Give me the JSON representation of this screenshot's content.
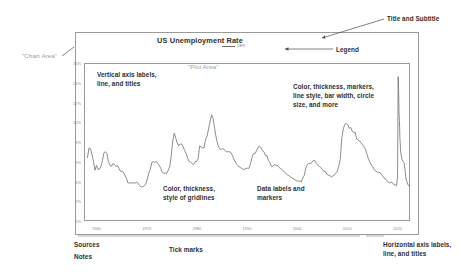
{
  "chart": {
    "title": "US Unemployment Rate",
    "legend_label": "UER"
  },
  "annotations": {
    "title_subtitle": "Title and Subtitle",
    "legend": "Legend",
    "chart_area": "\"Chart Area\"",
    "plot_area": "\"Plot Area\"",
    "vertical_axis": "Vertical axis labels,\nline, and titles",
    "color_thickness_markers": "Color, thickness, markers,\nline style, bar width, circle\nsize, and more",
    "gridlines": "Color, thickness,\nstyle of gridlines",
    "data_labels": "Data labels and\nmarkers",
    "sources": "Sources",
    "notes": "Notes",
    "tick_marks": "Tick marks",
    "horizontal_axis": "Horizontal axis labels,\nline, and titles"
  },
  "colors": {
    "line": "#6e6e6e",
    "frame": "#9a9a9a",
    "text": "#2f2f2f",
    "ghost_text": "#9e9e9e",
    "tick_text": "#8a8a8a",
    "background": "#ffffff"
  },
  "chart_data": {
    "type": "line",
    "title": "US Unemployment Rate",
    "xlabel": "",
    "ylabel": "",
    "xlim": [
      1957.5,
      2022.5
    ],
    "ylim": [
      0,
      16
    ],
    "grid": false,
    "legend_position": "top-center",
    "y_tick_labels": [
      "0%",
      "2%",
      "4%",
      "6%",
      "8%",
      "10%",
      "12%",
      "14%",
      "16%"
    ],
    "y_ticks": [
      0,
      2,
      4,
      6,
      8,
      10,
      12,
      14,
      16
    ],
    "x_tick_labels": [
      "1960",
      "1970",
      "1980",
      "1990",
      "2000",
      "2010",
      "2020"
    ],
    "x_ticks": [
      1960,
      1970,
      1980,
      1990,
      2000,
      2010,
      2020
    ],
    "series": [
      {
        "name": "UER",
        "x": [
          1958.0,
          1958.3,
          1958.6,
          1958.9,
          1959.2,
          1959.5,
          1959.8,
          1960.1,
          1960.4,
          1960.7,
          1961.0,
          1961.3,
          1961.6,
          1961.9,
          1962.2,
          1962.5,
          1962.8,
          1963.1,
          1963.4,
          1963.7,
          1964.0,
          1964.3,
          1964.6,
          1964.9,
          1965.2,
          1965.5,
          1965.8,
          1966.1,
          1966.4,
          1966.7,
          1967.0,
          1967.3,
          1967.6,
          1967.9,
          1968.2,
          1968.5,
          1968.8,
          1969.1,
          1969.4,
          1969.7,
          1970.0,
          1970.3,
          1970.6,
          1970.9,
          1971.2,
          1971.5,
          1971.8,
          1972.1,
          1972.4,
          1972.7,
          1973.0,
          1973.3,
          1973.6,
          1973.9,
          1974.2,
          1974.5,
          1974.8,
          1975.1,
          1975.4,
          1975.7,
          1976.0,
          1976.3,
          1976.6,
          1976.9,
          1977.2,
          1977.5,
          1977.8,
          1978.1,
          1978.4,
          1978.7,
          1979.0,
          1979.3,
          1979.6,
          1979.9,
          1980.2,
          1980.5,
          1980.8,
          1981.1,
          1981.4,
          1981.7,
          1982.0,
          1982.3,
          1982.6,
          1982.9,
          1983.2,
          1983.5,
          1983.8,
          1984.1,
          1984.4,
          1984.7,
          1985.0,
          1985.3,
          1985.6,
          1985.9,
          1986.2,
          1986.5,
          1986.8,
          1987.1,
          1987.4,
          1987.7,
          1988.0,
          1988.3,
          1988.6,
          1988.9,
          1989.2,
          1989.5,
          1989.8,
          1990.1,
          1990.4,
          1990.7,
          1991.0,
          1991.3,
          1991.6,
          1991.9,
          1992.2,
          1992.5,
          1992.8,
          1993.1,
          1993.4,
          1993.7,
          1994.0,
          1994.3,
          1994.6,
          1994.9,
          1995.2,
          1995.5,
          1995.8,
          1996.1,
          1996.4,
          1996.7,
          1997.0,
          1997.3,
          1997.6,
          1997.9,
          1998.2,
          1998.5,
          1998.8,
          1999.1,
          1999.4,
          1999.7,
          2000.0,
          2000.3,
          2000.6,
          2000.9,
          2001.2,
          2001.5,
          2001.8,
          2002.1,
          2002.4,
          2002.7,
          2003.0,
          2003.3,
          2003.6,
          2003.9,
          2004.2,
          2004.5,
          2004.8,
          2005.1,
          2005.4,
          2005.7,
          2006.0,
          2006.3,
          2006.6,
          2006.9,
          2007.2,
          2007.5,
          2007.8,
          2008.1,
          2008.4,
          2008.7,
          2009.0,
          2009.3,
          2009.6,
          2009.9,
          2010.2,
          2010.5,
          2010.8,
          2011.1,
          2011.4,
          2011.7,
          2012.0,
          2012.3,
          2012.6,
          2012.9,
          2013.2,
          2013.5,
          2013.8,
          2014.1,
          2014.4,
          2014.7,
          2015.0,
          2015.3,
          2015.6,
          2015.9,
          2016.2,
          2016.5,
          2016.8,
          2017.1,
          2017.4,
          2017.7,
          2018.0,
          2018.3,
          2018.6,
          2018.9,
          2019.2,
          2019.5,
          2019.8,
          2020.0,
          2020.2,
          2020.33,
          2020.42,
          2020.5,
          2020.58,
          2020.67,
          2020.75,
          2020.83,
          2020.92,
          2021.1,
          2021.3,
          2021.5,
          2021.7,
          2021.9,
          2022.1,
          2022.3,
          2022.5
        ],
        "y": [
          6.4,
          7.4,
          7.3,
          6.7,
          6.0,
          5.1,
          5.6,
          5.2,
          5.2,
          5.5,
          6.1,
          6.9,
          7.0,
          6.8,
          6.0,
          5.6,
          5.5,
          5.8,
          5.7,
          5.5,
          5.6,
          5.3,
          5.0,
          5.0,
          4.9,
          4.6,
          4.3,
          3.8,
          3.8,
          3.8,
          3.8,
          3.8,
          3.8,
          3.9,
          3.7,
          3.5,
          3.4,
          3.4,
          3.5,
          3.7,
          4.2,
          4.8,
          5.2,
          5.9,
          6.0,
          5.9,
          6.0,
          5.8,
          5.6,
          5.3,
          4.9,
          4.8,
          4.8,
          4.8,
          5.1,
          5.5,
          6.6,
          8.1,
          8.9,
          8.4,
          7.9,
          7.6,
          7.8,
          7.8,
          7.5,
          7.1,
          6.8,
          6.3,
          6.0,
          5.9,
          5.8,
          5.7,
          6.0,
          6.0,
          6.3,
          7.6,
          7.5,
          7.4,
          7.4,
          8.3,
          8.6,
          9.4,
          10.1,
          10.8,
          10.4,
          9.4,
          8.5,
          7.8,
          7.4,
          7.2,
          7.3,
          7.3,
          7.1,
          7.0,
          7.0,
          7.0,
          6.9,
          6.6,
          6.2,
          5.9,
          5.7,
          5.5,
          5.4,
          5.3,
          5.2,
          5.2,
          5.3,
          5.3,
          5.3,
          5.8,
          6.4,
          6.8,
          6.8,
          7.1,
          7.4,
          7.6,
          7.4,
          7.1,
          7.0,
          6.6,
          6.6,
          6.1,
          5.9,
          5.5,
          5.5,
          5.7,
          5.6,
          5.6,
          5.4,
          5.3,
          5.2,
          5.0,
          4.9,
          4.7,
          4.6,
          4.5,
          4.4,
          4.3,
          4.2,
          4.1,
          4.0,
          4.0,
          4.0,
          3.9,
          4.3,
          4.6,
          5.3,
          5.7,
          5.8,
          5.8,
          5.9,
          6.1,
          6.1,
          5.8,
          5.6,
          5.5,
          5.4,
          5.2,
          5.0,
          5.0,
          4.7,
          4.6,
          4.6,
          4.4,
          4.5,
          4.6,
          4.8,
          5.0,
          5.5,
          6.2,
          8.3,
          9.3,
          9.8,
          9.9,
          9.8,
          9.4,
          9.5,
          9.1,
          9.0,
          9.0,
          8.3,
          8.2,
          8.1,
          7.9,
          7.7,
          7.5,
          7.2,
          6.7,
          6.2,
          5.9,
          5.6,
          5.4,
          5.1,
          5.0,
          4.9,
          4.9,
          4.8,
          4.6,
          4.4,
          4.2,
          4.1,
          3.9,
          3.8,
          3.9,
          3.8,
          3.6,
          3.6,
          3.5,
          4.4,
          14.7,
          13.2,
          11.0,
          10.2,
          8.4,
          7.8,
          6.9,
          6.7,
          6.2,
          6.0,
          5.9,
          5.2,
          4.2,
          3.9,
          3.6,
          3.5
        ]
      }
    ]
  }
}
